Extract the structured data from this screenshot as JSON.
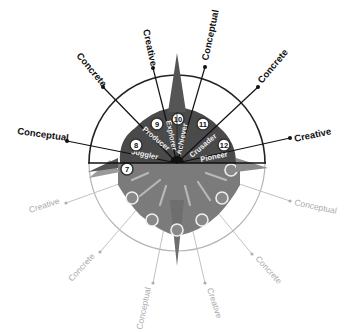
{
  "diagram": {
    "center": {
      "x": 177,
      "y": 163
    },
    "outer_radius": 88,
    "colors": {
      "dark_fan": "#4a4a4a",
      "upper_segment": "#3e3e3e",
      "lower_fan": "#7a7a7a",
      "ghost_line": "#bdbdbd",
      "ink": "#111111"
    },
    "upper_segments": [
      {
        "number": "7",
        "name": "",
        "angle": 180
      },
      {
        "number": "8",
        "name": "Juggler",
        "angle": 160
      },
      {
        "number": "9",
        "name": "Producer",
        "angle": 135
      },
      {
        "number": "10",
        "name": "Explorer",
        "angle": 100
      },
      {
        "number": "11",
        "name": "Achiever",
        "angle": 80
      },
      {
        "number": "12",
        "name": "Crusader",
        "angle": 45
      },
      {
        "number": "",
        "name": "Pioneer",
        "angle": 20
      }
    ],
    "upper_arrows": [
      {
        "label": "Conceptual",
        "angle": 165
      },
      {
        "label": "Concrete",
        "angle": 130
      },
      {
        "label": "Creative",
        "angle": 100
      },
      {
        "label": "Conceptual",
        "angle": 78
      },
      {
        "label": "Concrete",
        "angle": 45
      },
      {
        "label": "Creative",
        "angle": 15
      }
    ],
    "lower_arrows": [
      {
        "label": "Creative",
        "angle": 200
      },
      {
        "label": "Concrete",
        "angle": 232
      },
      {
        "label": "Conceptual",
        "angle": 258
      },
      {
        "label": "Creative",
        "angle": 285
      },
      {
        "label": "Concrete",
        "angle": 310
      },
      {
        "label": "Conceptual",
        "angle": 343
      }
    ]
  }
}
